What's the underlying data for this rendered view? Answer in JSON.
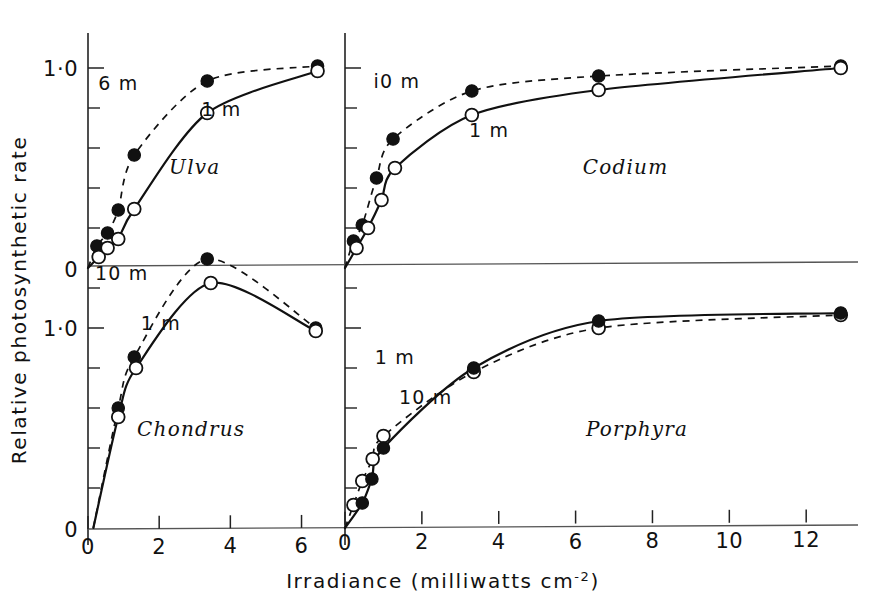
{
  "figure": {
    "xlabel_main": "Irradiance (milliwatts cm",
    "xlabel_sup": "-2",
    "xlabel_close": ")",
    "ylabel": "Relative photosynthetic rate",
    "background": "#ffffff",
    "ink": "#111111"
  },
  "axes": {
    "y_ticklabels": [
      "1·0",
      "0"
    ],
    "y_tick_values": [
      1.0,
      0.0
    ],
    "y_minor_count": 5,
    "x_ticklabels_left": [
      "0",
      "2",
      "4",
      "6"
    ],
    "x_tickvalues_left": [
      0,
      2,
      4,
      6
    ],
    "x_ticklabels_right": [
      "0",
      "2",
      "4",
      "6",
      "8",
      "10",
      "12"
    ],
    "x_tickvalues_right": [
      0,
      2,
      4,
      6,
      8,
      10,
      12
    ]
  },
  "chart_data": {
    "type": "scatter",
    "title": "",
    "xlabel": "Irradiance (milliwatts cm-2)",
    "ylabel": "Relative photosynthetic rate",
    "grid": false,
    "legend": "inline annotations",
    "panels": [
      {
        "id": "ulva",
        "species": "Ulva",
        "position": "top-left",
        "xlim": [
          0,
          6.8
        ],
        "ylim": [
          0,
          1.12
        ],
        "series": [
          {
            "name": "6 m",
            "label": "6 m",
            "marker": "filled-circle",
            "line": "dashed",
            "label_x": 0.85,
            "label_y": 0.89,
            "x": [
              0.0,
              0.25,
              0.55,
              0.85,
              1.3,
              3.35,
              6.45
            ],
            "y": [
              0.0,
              0.11,
              0.175,
              0.29,
              0.565,
              0.935,
              1.01
            ]
          },
          {
            "name": "1 m",
            "label": "1 m",
            "marker": "open-circle",
            "line": "solid",
            "label_x": 3.75,
            "label_y": 0.76,
            "x": [
              0.0,
              0.3,
              0.55,
              0.85,
              1.3,
              3.35,
              6.45
            ],
            "y": [
              0.0,
              0.055,
              0.1,
              0.145,
              0.295,
              0.775,
              0.985
            ]
          }
        ]
      },
      {
        "id": "codium",
        "species": "Codium",
        "position": "top-right",
        "xlim": [
          0,
          13.4
        ],
        "ylim": [
          0,
          1.12
        ],
        "series": [
          {
            "name": "10 m",
            "label": "i0 m",
            "marker": "filled-circle",
            "line": "dashed",
            "label_x": 1.35,
            "label_y": 0.9,
            "x": [
              0.0,
              0.22,
              0.45,
              0.82,
              1.25,
              3.3,
              6.6,
              12.9
            ],
            "y": [
              0.0,
              0.135,
              0.215,
              0.45,
              0.645,
              0.885,
              0.96,
              1.01
            ]
          },
          {
            "name": "1 m",
            "label": "1 m",
            "marker": "open-circle",
            "line": "solid",
            "label_x": 3.75,
            "label_y": 0.655,
            "x": [
              0.0,
              0.3,
              0.6,
              0.95,
              1.3,
              3.3,
              6.6,
              12.9
            ],
            "y": [
              0.0,
              0.1,
              0.2,
              0.34,
              0.5,
              0.765,
              0.89,
              1.0
            ]
          }
        ]
      },
      {
        "id": "chondrus",
        "species": "Chondrus",
        "position": "bottom-left",
        "xlim": [
          0,
          6.8
        ],
        "ylim": [
          0,
          1.42
        ],
        "series": [
          {
            "name": "10 m",
            "label": "10 m",
            "marker": "filled-circle",
            "line": "dashed",
            "label_x": 0.95,
            "label_y": 1.24,
            "x": [
              0.15,
              0.85,
              1.3,
              3.35,
              6.4
            ],
            "y": [
              0.0,
              0.6,
              0.855,
              1.345,
              1.0
            ]
          },
          {
            "name": "1 m",
            "label": "1 m",
            "marker": "open-circle",
            "line": "solid",
            "label_x": 2.05,
            "label_y": 0.99,
            "x": [
              0.15,
              0.85,
              1.35,
              3.45,
              6.4
            ],
            "y": [
              0.0,
              0.555,
              0.8,
              1.225,
              0.985
            ]
          }
        ]
      },
      {
        "id": "porphyra",
        "species": "Porphyra",
        "position": "bottom-right",
        "xlim": [
          0,
          13.4
        ],
        "ylim": [
          0,
          1.22
        ],
        "series": [
          {
            "name": "1 m",
            "label": "1 m",
            "marker": "open-circle",
            "line": "dashed",
            "label_x": 1.3,
            "label_y": 0.82,
            "x": [
              0.0,
              0.22,
              0.45,
              0.72,
              1.0,
              3.35,
              6.6,
              12.9
            ],
            "y": [
              0.0,
              0.115,
              0.235,
              0.345,
              0.46,
              0.78,
              1.0,
              1.065
            ]
          },
          {
            "name": "10 m",
            "label": "10 m",
            "marker": "filled-circle",
            "line": "solid",
            "label_x": 2.1,
            "label_y": 0.62,
            "x": [
              0.0,
              0.45,
              0.7,
              1.0,
              3.35,
              6.6,
              12.9
            ],
            "y": [
              0.0,
              0.125,
              0.245,
              0.4,
              0.8,
              1.035,
              1.075
            ]
          }
        ]
      }
    ]
  }
}
